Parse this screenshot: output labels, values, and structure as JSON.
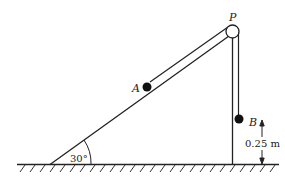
{
  "diagram": {
    "labels": {
      "pulley": "P",
      "particle_a": "A",
      "particle_b": "B",
      "angle": "30°",
      "height": "0.25 m"
    },
    "colors": {
      "line": "#222222",
      "particle": "#111111",
      "background": "#ffffff"
    }
  }
}
